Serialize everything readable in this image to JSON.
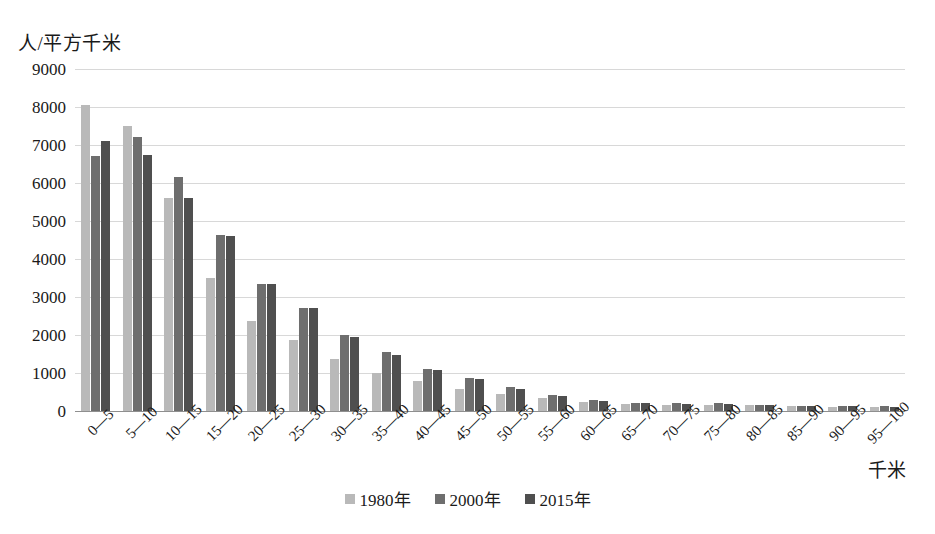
{
  "chart_data": {
    "type": "bar",
    "title": "",
    "subtitle": "",
    "xlabel": "千米",
    "ylabel": "人/平方千米",
    "ylim": [
      0,
      9000
    ],
    "ytick_step": 1000,
    "yticks": [
      "9000",
      "8000",
      "7000",
      "6000",
      "5000",
      "4000",
      "3000",
      "2000",
      "1000",
      "0"
    ],
    "grid": true,
    "legend_position": "bottom-center",
    "categories": [
      "0—5",
      "5—10",
      "10—15",
      "15—20",
      "20—25",
      "25—30",
      "30—35",
      "35—40",
      "40—45",
      "45—50",
      "50—55",
      "55—60",
      "60—65",
      "65—70",
      "70—75",
      "75—80",
      "80—85",
      "85—90",
      "90—95",
      "95—100"
    ],
    "series": [
      {
        "name": "1980年",
        "color": "#b9b9b9",
        "values": [
          8050,
          7500,
          5600,
          3500,
          2380,
          1880,
          1380,
          1000,
          780,
          580,
          450,
          330,
          250,
          180,
          170,
          170,
          150,
          120,
          110,
          100
        ]
      },
      {
        "name": "2000年",
        "color": "#6e6e6e",
        "values": [
          6700,
          7200,
          6150,
          4620,
          3330,
          2720,
          2000,
          1550,
          1100,
          880,
          640,
          430,
          290,
          210,
          200,
          200,
          170,
          140,
          130,
          120
        ]
      },
      {
        "name": "2015年",
        "color": "#4f4f4f",
        "values": [
          7100,
          6750,
          5600,
          4600,
          3330,
          2700,
          1950,
          1480,
          1080,
          850,
          580,
          400,
          270,
          200,
          190,
          190,
          160,
          130,
          120,
          110
        ]
      }
    ]
  },
  "legend": {
    "items": [
      {
        "label": "1980年"
      },
      {
        "label": "2000年"
      },
      {
        "label": "2015年"
      }
    ]
  }
}
